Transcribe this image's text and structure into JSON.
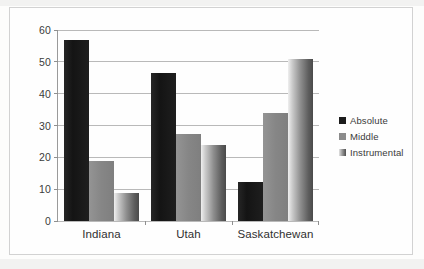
{
  "chart_data": {
    "type": "bar",
    "title": "",
    "subtitle": "",
    "xlabel": "",
    "ylabel": "",
    "categories": [
      "Indiana",
      "Utah",
      "Saskatchewan"
    ],
    "series": [
      {
        "name": "Absolute",
        "values": [
          57.0,
          46.5,
          12.3
        ],
        "color": "#1c1c1c"
      },
      {
        "name": "Middle",
        "values": [
          18.7,
          27.2,
          34.0
        ],
        "color": "#8b8b8b"
      },
      {
        "name": "Instrumental",
        "values": [
          8.8,
          24.0,
          51.0
        ],
        "color": "#6f6f6f"
      }
    ],
    "ylim": [
      0,
      60
    ],
    "yticks": [
      0,
      10,
      20,
      30,
      40,
      50,
      60
    ],
    "ytick_labels": [
      "0",
      "10",
      "20",
      "30",
      "40",
      "50",
      "60"
    ],
    "grid": true,
    "legend_position": "right",
    "annotations": []
  },
  "legend": {
    "entries": [
      {
        "label": "Absolute",
        "swatch": "legend-swatch-absolute"
      },
      {
        "label": "Middle",
        "swatch": "legend-swatch-middle"
      },
      {
        "label": "Instrumental",
        "swatch": "legend-swatch-instrumental"
      }
    ]
  },
  "colors": {
    "absolute": "#1c1c1c",
    "middle": "#8b8b8b",
    "instrumental": "#6f6f6f",
    "gridline": "#b9b9b9",
    "axis": "#9a9a9a",
    "frame": "#d2d2d2",
    "text": "#303030",
    "background": "#fefefe"
  }
}
